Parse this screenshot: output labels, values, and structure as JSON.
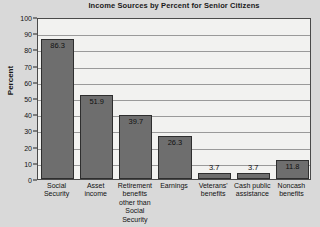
{
  "chart_data": {
    "type": "bar",
    "title": "Income Sources by Percent for Senior Citizens",
    "xlabel": "",
    "ylabel": "Percent",
    "ylim": [
      0,
      100
    ],
    "ytick_step": 10,
    "yticks": [
      "0",
      "10",
      "20",
      "30",
      "40",
      "50",
      "60",
      "70",
      "80",
      "90",
      "100"
    ],
    "grid": true,
    "legend": "none",
    "categories": [
      "Social Security",
      "Asset income",
      "Retirement benefits other than Social Security",
      "Earnings",
      "Veterans' benefits",
      "Cash public assistance",
      "Noncash benefits"
    ],
    "category_lines": [
      [
        "Social",
        "Security"
      ],
      [
        "Asset",
        "income"
      ],
      [
        "Retirement",
        "benefits",
        "other than",
        "Social Security"
      ],
      [
        "Earnings"
      ],
      [
        "Veterans'",
        "benefits"
      ],
      [
        "Cash public",
        "assistance"
      ],
      [
        "Noncash",
        "benefits"
      ]
    ],
    "values": [
      86.3,
      51.9,
      39.7,
      26.3,
      3.7,
      3.7,
      11.8
    ],
    "value_labels": [
      "86.3",
      "51.9",
      "39.7",
      "26.3",
      "3.7",
      "3.7",
      "11.8"
    ],
    "colors": {
      "bar_fill": "#6e6e6e",
      "bar_border": "#2e2e2e",
      "plot_background": "#f2f2f0",
      "page_background": "#d9d9d9",
      "gridline": "#9a9a9a",
      "axis": "#4a4a4a",
      "text": "#111111"
    }
  }
}
